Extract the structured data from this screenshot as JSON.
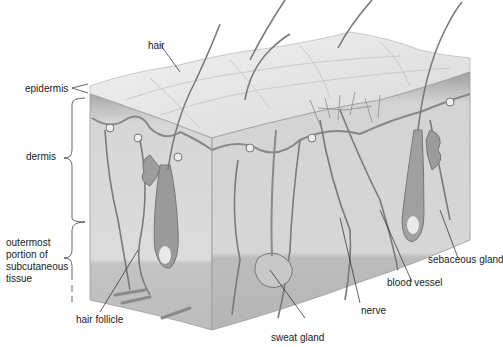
{
  "diagram": {
    "labels": {
      "hair": "hair",
      "epidermis": "epidermis",
      "dermis": "dermis",
      "subcutaneous": "outermost portion of subcutaneous tissue",
      "hair_follicle": "hair follicle",
      "sweat_gland": "sweat gland",
      "nerve": "nerve",
      "blood_vessel": "blood vessel",
      "sebaceous_gland": "sebaceous gland"
    },
    "colors": {
      "surface": "#e6e6e6",
      "epidermis_band": "#a8a8a8",
      "dermis": "#d9d9d9",
      "subcutaneous": "#c4c4c4",
      "vessel": "#7a7a7a",
      "label_line": "#222222"
    }
  }
}
